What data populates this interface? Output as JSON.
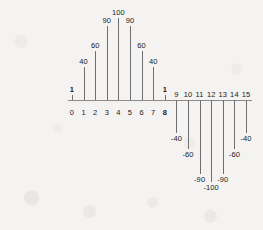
{
  "chart_data": {
    "type": "bar",
    "title": "",
    "subtitle": "",
    "xlabel": "",
    "ylabel": "",
    "grid": false,
    "legend": null,
    "axis": {
      "x_range": [
        0,
        15
      ],
      "y_range": [
        -100,
        100
      ],
      "x_axis_at_y": 0,
      "style": "stem plot with baseline at zero"
    },
    "categories": [
      "0",
      "1",
      "2",
      "3",
      "4",
      "5",
      "6",
      "7",
      "8",
      "9",
      "10",
      "11",
      "12",
      "13",
      "14",
      "15"
    ],
    "values": [
      1,
      40,
      60,
      90,
      100,
      90,
      60,
      40,
      1,
      -40,
      -60,
      -90,
      -100,
      -90,
      -60,
      -40
    ],
    "x_tick_labels": [
      "0",
      "1",
      "2",
      "3",
      "4",
      "5",
      "6",
      "7",
      "8",
      "9",
      "10",
      "11",
      "12",
      "13",
      "14",
      "15"
    ],
    "x_tick_labels_below_axis": [
      "0",
      "1",
      "2",
      "3",
      "4",
      "5",
      "6",
      "7",
      "8"
    ],
    "x_tick_labels_above_axis": [
      "9",
      "10",
      "11",
      "12",
      "13",
      "14",
      "15"
    ],
    "data_labels": [
      "1",
      "40",
      "60",
      "90",
      "100",
      "90",
      "60",
      "40",
      "1",
      "-40",
      "-60",
      "-90",
      "-100",
      "-90",
      "-60",
      "-40"
    ],
    "emphasized_labels": [
      "1",
      "8"
    ],
    "colors": {
      "background": "#f4f3f1",
      "axis": "#8b8b8b",
      "stem": "#6f6f6f",
      "text": "#1a1a1a"
    }
  },
  "points": [
    {
      "index": "0",
      "value": "1",
      "label": "1",
      "tick": "0",
      "side": "positive",
      "bold_value": true,
      "bold_tick": false
    },
    {
      "index": "1",
      "value": "40",
      "label": "40",
      "tick": "1",
      "side": "positive",
      "bold_value": false,
      "bold_tick": false
    },
    {
      "index": "2",
      "value": "60",
      "label": "60",
      "tick": "2",
      "side": "positive",
      "bold_value": false,
      "bold_tick": false
    },
    {
      "index": "3",
      "value": "90",
      "label": "90",
      "tick": "3",
      "side": "positive",
      "bold_value": false,
      "bold_tick": false
    },
    {
      "index": "4",
      "value": "100",
      "label": "100",
      "tick": "4",
      "side": "positive",
      "bold_value": false,
      "bold_tick": false
    },
    {
      "index": "5",
      "value": "90",
      "label": "90",
      "tick": "5",
      "side": "positive",
      "bold_value": false,
      "bold_tick": false
    },
    {
      "index": "6",
      "value": "60",
      "label": "60",
      "tick": "6",
      "side": "positive",
      "bold_value": false,
      "bold_tick": false
    },
    {
      "index": "7",
      "value": "40",
      "label": "40",
      "tick": "7",
      "side": "positive",
      "bold_value": false,
      "bold_tick": false
    },
    {
      "index": "8",
      "value": "1",
      "label": "1",
      "tick": "8",
      "side": "positive",
      "bold_value": true,
      "bold_tick": true
    },
    {
      "index": "9",
      "value": "-40",
      "label": "-40",
      "tick": "9",
      "side": "negative",
      "bold_value": false,
      "bold_tick": false
    },
    {
      "index": "10",
      "value": "-60",
      "label": "-60",
      "tick": "10",
      "side": "negative",
      "bold_value": false,
      "bold_tick": false
    },
    {
      "index": "11",
      "value": "-90",
      "label": "-90",
      "tick": "11",
      "side": "negative",
      "bold_value": false,
      "bold_tick": false
    },
    {
      "index": "12",
      "value": "-100",
      "label": "-100",
      "tick": "12",
      "side": "negative",
      "bold_value": false,
      "bold_tick": false
    },
    {
      "index": "13",
      "value": "-90",
      "label": "-90",
      "tick": "13",
      "side": "negative",
      "bold_value": false,
      "bold_tick": false
    },
    {
      "index": "14",
      "value": "-60",
      "label": "-60",
      "tick": "14",
      "side": "negative",
      "bold_value": false,
      "bold_tick": false
    },
    {
      "index": "15",
      "value": "-40",
      "label": "-40",
      "tick": "15",
      "side": "negative",
      "bold_value": false,
      "bold_tick": false
    }
  ]
}
